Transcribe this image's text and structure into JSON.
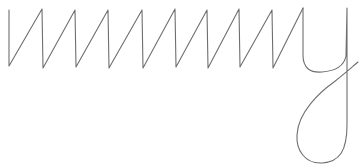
{
  "drawing": {
    "background": "#ffffff",
    "stroke_color": "#6e6e6e",
    "stroke_width": 1.1,
    "description": "freehand handwriting stroke: zigzag sawtooth followed by a looping y-like descender",
    "zigzag_path": "M9,10 L9,66 L42,9 L43,68 L75,10 L76,67 L108,10 L109,68 L142,10 L143,68 L175,9 L176,67 L207,10 L208,68 L239,9 L240,67 L272,10 L273,68 L303,8",
    "descender_path": "M303,8 L303,55 C303,68 310,73 322,72 C336,71 344,66 346,56 L347,8 L347,125 C347,150 340,162 322,163 C305,164 296,150 297,135 C298,112 320,92 334,82 C344,74 352,67 358,62"
  }
}
